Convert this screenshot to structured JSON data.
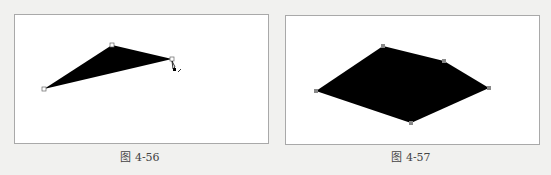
{
  "figures": [
    {
      "caption": "图 4-56",
      "shape": "triangle",
      "points": [
        [
          44,
          89
        ],
        [
          112,
          45
        ],
        [
          172,
          59
        ]
      ]
    },
    {
      "caption": "图 4-57",
      "shape": "pentagon",
      "points": [
        [
          316,
          91
        ],
        [
          383,
          46
        ],
        [
          444,
          61
        ],
        [
          489,
          88
        ],
        [
          411,
          123
        ]
      ]
    }
  ],
  "colors": {
    "fill": "#000000",
    "frame": "#a9a9a9",
    "background": "#f1f1ef"
  }
}
